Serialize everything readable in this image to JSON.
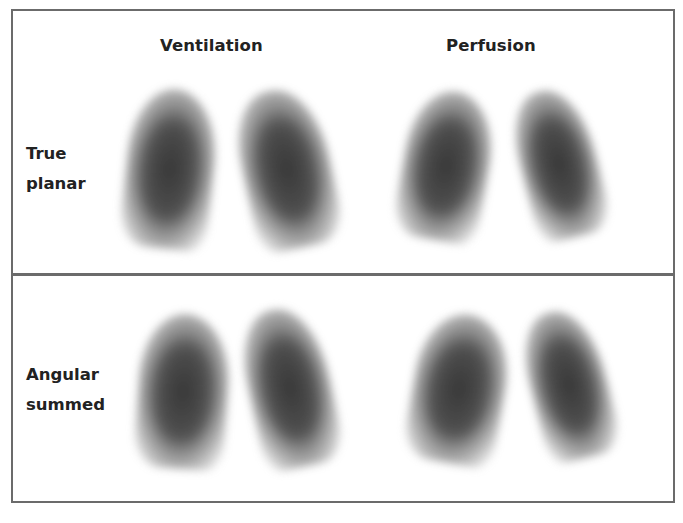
{
  "figure": {
    "column_headers": [
      {
        "label": "Ventilation",
        "x": 147
      },
      {
        "label": "Perfusion",
        "x": 433
      }
    ],
    "rows": [
      {
        "label": "True\nplanar",
        "label_top": 128,
        "panel": "top",
        "lungs": [
          {
            "side": "left",
            "x": 113,
            "y": 78,
            "w": 88,
            "h": 160,
            "rotate": 6
          },
          {
            "side": "right",
            "x": 230,
            "y": 78,
            "w": 88,
            "h": 160,
            "rotate": -12
          },
          {
            "side": "left",
            "x": 390,
            "y": 80,
            "w": 86,
            "h": 150,
            "rotate": 10
          },
          {
            "side": "right",
            "x": 508,
            "y": 78,
            "w": 76,
            "h": 150,
            "rotate": -14
          }
        ]
      },
      {
        "label": "Angular\nsummed",
        "label_top": 84,
        "panel": "bottom",
        "lungs": [
          {
            "side": "left",
            "x": 125,
            "y": 38,
            "w": 90,
            "h": 155,
            "rotate": 4
          },
          {
            "side": "right",
            "x": 236,
            "y": 32,
            "w": 82,
            "h": 160,
            "rotate": -12
          },
          {
            "side": "left",
            "x": 400,
            "y": 38,
            "w": 92,
            "h": 150,
            "rotate": 10
          },
          {
            "side": "right",
            "x": 518,
            "y": 34,
            "w": 76,
            "h": 150,
            "rotate": -14
          }
        ]
      }
    ],
    "border_color": "#6b6b6b"
  }
}
